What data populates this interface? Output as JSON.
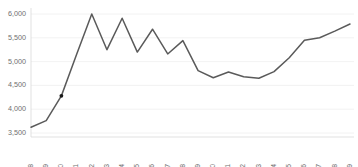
{
  "chart_data": {
    "type": "line",
    "title": "",
    "subtitle": "",
    "xlabel": "",
    "ylabel": "",
    "grid": true,
    "legend": false,
    "legend_position": "none",
    "line_color": "#5a5a5a",
    "marker_color": "#1a1a1a",
    "grid_color": "#efefef",
    "tick_label_color": "#6f6f6f",
    "background_color": "#ffffff",
    "ylim": [
      3500,
      6100
    ],
    "yticks": [
      3500,
      4000,
      4500,
      5000,
      5500,
      6000
    ],
    "ytick_labels": [
      "3,500",
      "4,000",
      "4,500",
      "5,000",
      "5,500",
      "6,000"
    ],
    "categories": [
      "1998",
      "1999",
      "2000",
      "2001",
      "2002",
      "2003",
      "2004",
      "2005",
      "2006",
      "2007",
      "2008",
      "2009",
      "2010",
      "2011",
      "2012",
      "2013",
      "2014",
      "2015",
      "2016",
      "2017",
      "2018",
      "2019"
    ],
    "values": [
      3620,
      3760,
      4280,
      5150,
      6000,
      5250,
      5910,
      5200,
      5680,
      5160,
      5440,
      4810,
      4660,
      4780,
      4680,
      4650,
      4790,
      5080,
      5450,
      5500,
      5640,
      5790
    ],
    "markers": [
      {
        "category": "2000",
        "value": 4280
      }
    ],
    "series": [
      {
        "name": "series-1",
        "values": [
          3620,
          3760,
          4280,
          5150,
          6000,
          5250,
          5910,
          5200,
          5680,
          5160,
          5440,
          4810,
          4660,
          4780,
          4680,
          4650,
          4790,
          5080,
          5450,
          5500,
          5640,
          5790
        ]
      }
    ]
  }
}
